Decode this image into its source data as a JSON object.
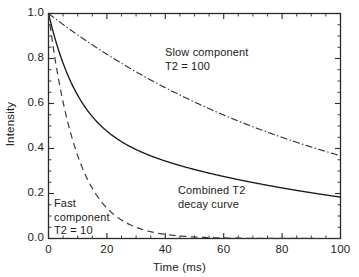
{
  "chart_data": {
    "type": "line",
    "title": "",
    "xlabel": "Time (ms)",
    "ylabel": "Intensity",
    "xlim": [
      0,
      100
    ],
    "ylim": [
      0,
      1.0
    ],
    "grid": false,
    "legend": "none (inline annotations)",
    "xticks": [
      "0",
      "20",
      "40",
      "60",
      "80",
      "100"
    ],
    "xtick_values": [
      0,
      20,
      40,
      60,
      80,
      100
    ],
    "xminor_interval": 5,
    "yticks": [
      "0.0",
      "0.2",
      "0.4",
      "0.6",
      "0.8",
      "1.0"
    ],
    "ytick_values": [
      0.0,
      0.2,
      0.4,
      0.6,
      0.8,
      1.0
    ],
    "yminor_interval": 0.05,
    "x": [
      0,
      2,
      4,
      6,
      8,
      10,
      12,
      14,
      16,
      18,
      20,
      25,
      30,
      35,
      40,
      45,
      50,
      55,
      60,
      65,
      70,
      75,
      80,
      85,
      90,
      95,
      100
    ],
    "series": [
      {
        "name": "Slow component",
        "t2": 100,
        "style": "dash-dot",
        "formula": "exp(-t/100)",
        "values": [
          1.0,
          0.98,
          0.961,
          0.942,
          0.923,
          0.905,
          0.887,
          0.869,
          0.852,
          0.835,
          0.819,
          0.779,
          0.741,
          0.705,
          0.67,
          0.638,
          0.607,
          0.577,
          0.549,
          0.522,
          0.497,
          0.472,
          0.449,
          0.427,
          0.407,
          0.387,
          0.368
        ]
      },
      {
        "name": "Combined T2 decay curve",
        "style": "solid",
        "formula": "0.5*exp(-t/10) + 0.5*exp(-t/100)",
        "values": [
          1.0,
          0.899,
          0.816,
          0.746,
          0.686,
          0.636,
          0.594,
          0.558,
          0.527,
          0.5,
          0.477,
          0.431,
          0.396,
          0.368,
          0.344,
          0.324,
          0.307,
          0.291,
          0.276,
          0.262,
          0.249,
          0.236,
          0.225,
          0.214,
          0.204,
          0.194,
          0.184
        ]
      },
      {
        "name": "Fast component",
        "t2": 10,
        "style": "dashed",
        "formula": "exp(-t/10)",
        "values": [
          1.0,
          0.819,
          0.67,
          0.549,
          0.449,
          0.368,
          0.301,
          0.247,
          0.202,
          0.165,
          0.135,
          0.082,
          0.05,
          0.03,
          0.018,
          0.011,
          0.007,
          0.004,
          0.002,
          0.002,
          0.001,
          0.001,
          0.0,
          0.0,
          0.0,
          0.0,
          0.0
        ]
      }
    ],
    "annotations": [
      {
        "name": "slow-component",
        "lines": [
          "Slow component",
          "T2 = 100"
        ],
        "x_px": 165,
        "y_px": 46
      },
      {
        "name": "combined-curve",
        "lines": [
          "Combined T2",
          "decay curve"
        ],
        "x_px": 178,
        "y_px": 184
      },
      {
        "name": "fast-component",
        "lines": [
          "Fast",
          "component",
          "T2 = 10"
        ],
        "x_px": 54,
        "y_px": 197
      }
    ],
    "colors": {
      "axis": "#2a2a2a",
      "slow_component": "#2a2a2a",
      "combined": "#1a1a1a",
      "fast_component": "#3a3a3a",
      "background": "#ffffff"
    }
  }
}
